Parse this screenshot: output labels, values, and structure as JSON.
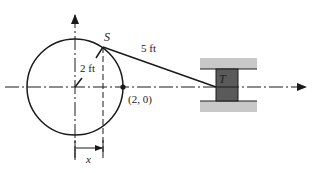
{
  "diagram": {
    "type": "slider-crank mechanism",
    "labels": {
      "crank_pin": "S",
      "slider": "T",
      "crank_length": "2 ft",
      "rod_length": "5 ft",
      "point": "(2, 0)",
      "displacement": "x"
    },
    "colors": {
      "line": "#1a1a1a",
      "rail": "#c8c8c8",
      "slider_block": "#5a5a5a",
      "background": "#ffffff"
    }
  }
}
